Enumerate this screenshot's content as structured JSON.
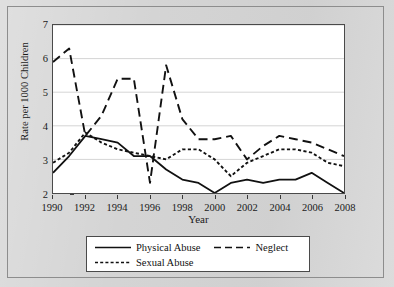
{
  "chart_data": {
    "type": "line",
    "title": "",
    "xlabel": "Year",
    "ylabel": "Rate per 1000 Children",
    "xlim": [
      1990,
      2008
    ],
    "ylim": [
      2,
      7
    ],
    "grid": true,
    "legend_position": "bottom",
    "x_ticks": [
      1990,
      1992,
      1994,
      1996,
      1998,
      2000,
      2002,
      2004,
      2006,
      2008
    ],
    "y_ticks": [
      2,
      3,
      4,
      5,
      6,
      7
    ],
    "x": [
      1990,
      1991,
      1992,
      1993,
      1994,
      1995,
      1996,
      1997,
      1998,
      1999,
      2000,
      2001,
      2002,
      2003,
      2004,
      2005,
      2006,
      2007,
      2008
    ],
    "series": [
      {
        "name": "Physical Abuse",
        "style": "solid",
        "values": [
          2.6,
          3.1,
          3.7,
          3.6,
          3.5,
          3.1,
          3.1,
          2.7,
          2.4,
          2.3,
          2.0,
          2.3,
          2.4,
          2.3,
          2.4,
          2.4,
          2.6,
          2.3,
          2.0
        ]
      },
      {
        "name": "Neglect",
        "style": "dashed",
        "values": [
          5.9,
          6.3,
          3.7,
          4.3,
          5.4,
          5.4,
          2.3,
          5.8,
          4.2,
          3.6,
          3.6,
          3.7,
          3.0,
          3.4,
          3.7,
          3.6,
          3.5,
          3.3,
          3.1
        ]
      },
      {
        "name": "Sexual Abuse",
        "style": "dotted",
        "values": [
          2.9,
          3.2,
          3.8,
          3.5,
          3.3,
          3.2,
          3.1,
          3.0,
          3.3,
          3.3,
          3.0,
          2.5,
          2.9,
          3.1,
          3.3,
          3.3,
          3.2,
          2.9,
          2.8
        ]
      }
    ]
  },
  "legend": {
    "items": [
      {
        "label": "Physical Abuse",
        "style": "solid"
      },
      {
        "label": "Neglect",
        "style": "dashed"
      },
      {
        "label": "Sexual Abuse",
        "style": "dotted"
      }
    ]
  }
}
